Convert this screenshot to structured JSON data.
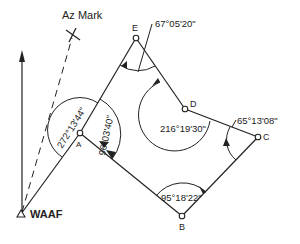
{
  "diagram": {
    "stations": [
      {
        "id": "WAAF",
        "label": "WAAF",
        "x": 21,
        "y": 214
      },
      {
        "id": "A",
        "label": "A",
        "x": 80,
        "y": 133
      },
      {
        "id": "E",
        "label": "E",
        "x": 136,
        "y": 38
      },
      {
        "id": "D",
        "label": "D",
        "x": 185,
        "y": 109
      },
      {
        "id": "C",
        "label": "C",
        "x": 258,
        "y": 137
      },
      {
        "id": "B",
        "label": "B",
        "x": 182,
        "y": 216
      }
    ],
    "az_mark": {
      "label": "Az Mark",
      "x": 73,
      "y": 35
    },
    "north_arrow": {
      "x": 22,
      "y_from": 212,
      "y_to": 52
    },
    "angles": [
      {
        "at": "A",
        "label": "272°13'44\"",
        "kind": "from-WAAF"
      },
      {
        "at": "A",
        "label": "96°03'40\""
      },
      {
        "at": "E",
        "label": "67°05'20\""
      },
      {
        "at": "D",
        "label": "216°19'30\""
      },
      {
        "at": "C",
        "label": "65°13'08\""
      },
      {
        "at": "B",
        "label": "95°18'22\""
      }
    ]
  }
}
